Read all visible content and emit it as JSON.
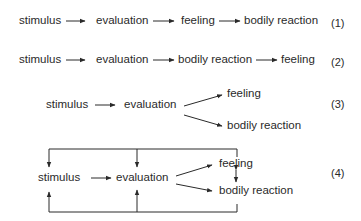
{
  "diagram": {
    "title": "",
    "models": [
      {
        "number": "(1)",
        "nodes": [
          "stimulus",
          "evaluation",
          "feeling",
          "bodily reaction"
        ],
        "edges": [
          [
            "stimulus",
            "evaluation"
          ],
          [
            "evaluation",
            "feeling"
          ],
          [
            "feeling",
            "bodily reaction"
          ]
        ]
      },
      {
        "number": "(2)",
        "nodes": [
          "stimulus",
          "evaluation",
          "bodily reaction",
          "feeling"
        ],
        "edges": [
          [
            "stimulus",
            "evaluation"
          ],
          [
            "evaluation",
            "bodily reaction"
          ],
          [
            "bodily reaction",
            "feeling"
          ]
        ]
      },
      {
        "number": "(3)",
        "nodes": [
          "stimulus",
          "evaluation",
          "feeling",
          "bodily reaction"
        ],
        "edges": [
          [
            "stimulus",
            "evaluation"
          ],
          [
            "evaluation",
            "feeling"
          ],
          [
            "evaluation",
            "bodily reaction"
          ]
        ]
      },
      {
        "number": "(4)",
        "nodes": [
          "stimulus",
          "evaluation",
          "feeling",
          "bodily reaction"
        ],
        "edges": [
          [
            "stimulus",
            "evaluation"
          ],
          [
            "evaluation",
            "feeling"
          ],
          [
            "evaluation",
            "bodily reaction"
          ],
          [
            "feeling",
            "bodily reaction",
            "bidirectional"
          ],
          [
            "feeling",
            "stimulus",
            "feedback-top"
          ],
          [
            "feeling",
            "evaluation",
            "feedback-top"
          ],
          [
            "bodily reaction",
            "stimulus",
            "feedback-bottom"
          ],
          [
            "bodily reaction",
            "evaluation",
            "feedback-bottom"
          ]
        ]
      }
    ],
    "line_color": "#2a2a2a"
  }
}
